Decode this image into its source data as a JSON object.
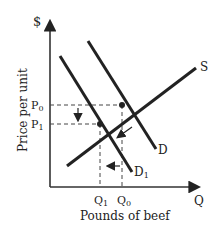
{
  "diagram": {
    "y_axis_symbol": "$",
    "y_axis_label": "Price per unit",
    "x_axis_symbol": "Q",
    "x_axis_label": "Pounds of beef",
    "price_labels": {
      "p0": "P0",
      "p1": "P1"
    },
    "quantity_labels": {
      "q0": "Q0",
      "q1": "Q1"
    },
    "curves": {
      "supply": "S",
      "demand": "D",
      "demand_new": "D1"
    },
    "colors": {
      "line": "#222222",
      "dashed": "#444444",
      "background": "#ffffff"
    }
  }
}
